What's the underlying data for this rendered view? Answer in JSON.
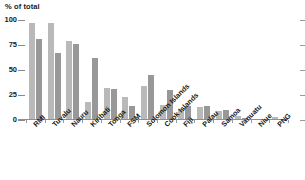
{
  "chart_data": {
    "type": "bar",
    "title": "% of total",
    "xlabel": "",
    "ylabel": "% of total",
    "ylim": [
      0,
      100
    ],
    "ytick_labels": [
      "0",
      "25",
      "50",
      "75",
      "100"
    ],
    "ytick_values": [
      0,
      25,
      50,
      75,
      100
    ],
    "grid": false,
    "legend": "none",
    "categories": [
      "RMI",
      "Tuvalu",
      "Nauru",
      "Kiribati",
      "Tonga",
      "FSM",
      "Solomon Islands",
      "Cook Islands",
      "Fiji",
      "Palau",
      "Samoa",
      "Vanuatu",
      "Niue",
      "PNG"
    ],
    "series": [
      {
        "name": "series-1",
        "values": [
          97,
          97,
          79,
          18,
          32,
          23,
          34,
          15,
          11,
          13,
          9,
          4,
          1,
          3
        ]
      },
      {
        "name": "series-2",
        "values": [
          81,
          67,
          76,
          62,
          31,
          14,
          45,
          30,
          14,
          14,
          10,
          2,
          1,
          1
        ]
      }
    ]
  }
}
